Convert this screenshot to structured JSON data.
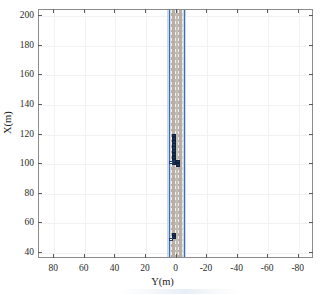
{
  "figure": {
    "background_color": "#ffffff",
    "axes_border_color": "#8c8c8c",
    "grid_color": "#f2f2f5"
  },
  "chart_data": {
    "type": "scatter",
    "title": "",
    "subtitle": "",
    "xlabel": "Y(m)",
    "ylabel": "X(m)",
    "xlim": [
      90,
      -90
    ],
    "ylim": [
      36,
      204
    ],
    "x_ticks": [
      80,
      60,
      40,
      20,
      0,
      -20,
      -40,
      -60,
      -80
    ],
    "x_tick_labels": [
      "80",
      "60",
      "40",
      "20",
      "0",
      "-20",
      "-40",
      "-60",
      "-80"
    ],
    "y_ticks": [
      40,
      60,
      80,
      100,
      120,
      140,
      160,
      180,
      200
    ],
    "y_tick_labels": [
      "40",
      "60",
      "80",
      "100",
      "120",
      "140",
      "160",
      "180",
      "200"
    ],
    "x_axis_reversed": true,
    "grid": true,
    "legend": null,
    "legend_position": "none",
    "annotations": [],
    "road": {
      "label": "road-corridor",
      "color": "#b8aea4",
      "inner_color": "#c3bcb4",
      "shoulder_color": "#cdd7e6",
      "edge_color": "#3b6fb5",
      "y_left_edge": 5.2,
      "y_right_edge": -5.2,
      "lane_marking_color": "#efefef",
      "lane_centers": [
        3.6,
        1.2,
        -1.2,
        -3.6
      ]
    },
    "series": [
      {
        "name": "vehicles",
        "marker": "rectangle",
        "color": "#1f3864",
        "edge_color": "#12203c",
        "points": [
          {
            "y": 1.8,
            "x": 119.4
          },
          {
            "y": 1.8,
            "x": 117.2
          },
          {
            "y": 1.8,
            "x": 115.1
          },
          {
            "y": 1.8,
            "x": 113.0
          },
          {
            "y": 1.8,
            "x": 110.8
          },
          {
            "y": 1.8,
            "x": 108.7
          },
          {
            "y": 1.8,
            "x": 106.6
          },
          {
            "y": 1.8,
            "x": 104.4
          },
          {
            "y": 1.8,
            "x": 102.3
          },
          {
            "y": 1.8,
            "x": 100.4
          },
          {
            "y": -0.9,
            "x": 101.8
          },
          {
            "y": -0.9,
            "x": 99.6
          },
          {
            "y": 1.8,
            "x": 52.6
          },
          {
            "y": 1.8,
            "x": 50.4
          }
        ]
      },
      {
        "name": "ego-vehicle",
        "marker": "rectangle",
        "color": "#fdfdfd",
        "edge_color": "#24406e",
        "points": [
          {
            "y": 3.6,
            "x": 101.0
          },
          {
            "y": 3.6,
            "x": 49.4
          }
        ]
      }
    ]
  },
  "axis": {
    "y_title": "X(m)",
    "x_title": "Y(m)"
  }
}
